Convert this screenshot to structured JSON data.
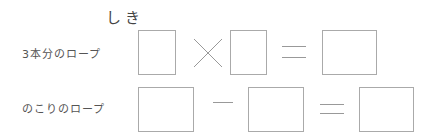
{
  "title": "しき",
  "rows": [
    {
      "label": "3本分のロープ",
      "operator": "×",
      "equals": "＝",
      "boxes": [
        "",
        "",
        ""
      ]
    },
    {
      "label": "のこりのロープ",
      "operator": "－",
      "equals": "＝",
      "boxes": [
        "",
        "",
        ""
      ]
    }
  ],
  "colors": {
    "box_border": "#aaaaaa",
    "text": "#555555"
  }
}
